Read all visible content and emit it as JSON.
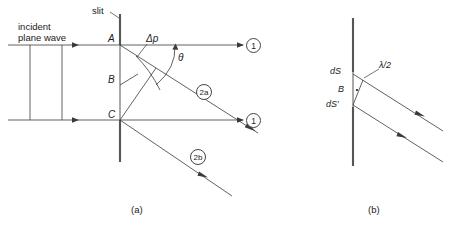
{
  "figure": {
    "stroke_color": "#3a3a3a",
    "text_color": "#1b1b1b",
    "background": "#ffffff"
  },
  "panel_a": {
    "caption": "(a)",
    "slit_label": "slit",
    "incident_line1": "incident",
    "incident_line2": "plane wave",
    "point_A": "A",
    "point_B": "B",
    "point_C": "C",
    "delta_p": "Δp",
    "theta": "θ",
    "ray_1_top": "1",
    "ray_1_bottom": "1",
    "ray_2a": "2a",
    "ray_2b": "2b"
  },
  "panel_b": {
    "caption": "(b)",
    "dS": "dS",
    "dS_prime": "dS′",
    "point_B": "B",
    "lambda_half": "λ/2"
  }
}
